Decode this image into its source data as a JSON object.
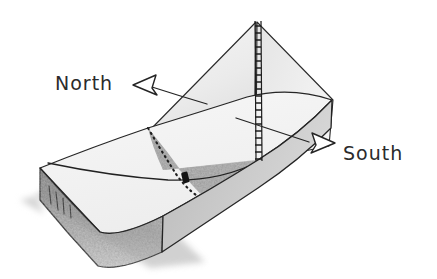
{
  "diagram": {
    "style": "pencil-sketch",
    "background_color": "#ffffff",
    "ink_color": "#222222",
    "labels": {
      "north": "North",
      "south": "South"
    },
    "icons": {
      "north_arrow": "arrow-left-outline-icon",
      "south_arrow": "arrow-right-outline-icon",
      "marker": "black-rectangle-marker-icon",
      "hatched_pole": "vertical-hatched-pole-icon"
    },
    "colors": {
      "top_surface": "#f2f2f2",
      "sail_plane": "#ececec",
      "shaded_wedge": "#9a9a9a",
      "front_face": "#8c8c8c",
      "side_face": "#b4b4b4",
      "drop_shadow": "#c8c8c8",
      "marker": "#1a1a1a"
    },
    "annotations": {
      "dotted_boundary": "dotted line separating light top surface from dark wedge",
      "curved_line": "curved trace across top surface passing through marker",
      "vertical_pole": "hatched vertical edge at plane apex"
    }
  }
}
